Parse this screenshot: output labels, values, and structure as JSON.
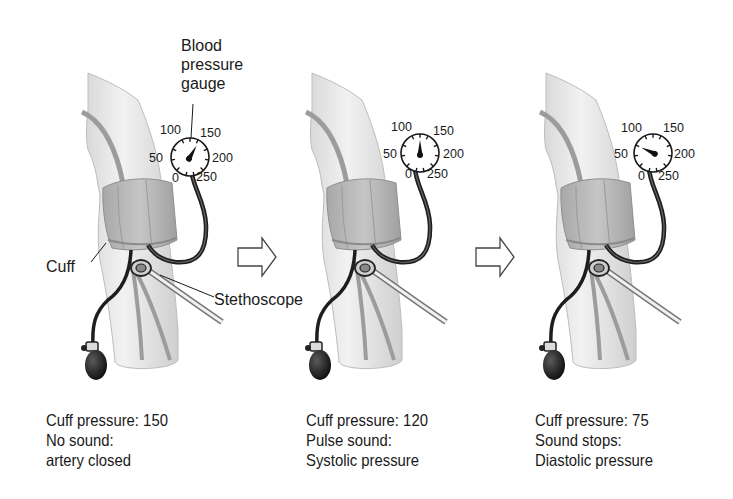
{
  "labels": {
    "gauge_title_line1": "Blood",
    "gauge_title_line2": "pressure",
    "gauge_title_line3": "gauge",
    "cuff": "Cuff",
    "stethoscope": "Stethoscope"
  },
  "gauge_scale": [
    "0",
    "50",
    "100",
    "150",
    "200",
    "250"
  ],
  "panels": [
    {
      "cuff_pressure": "Cuff pressure: 150",
      "sound": "No sound:",
      "meaning": "artery closed",
      "needle_value": 150
    },
    {
      "cuff_pressure": "Cuff pressure: 120",
      "sound": "Pulse sound:",
      "meaning": "Systolic pressure",
      "needle_value": 120
    },
    {
      "cuff_pressure": "Cuff pressure: 75",
      "sound": "Sound stops:",
      "meaning": "Diastolic pressure",
      "needle_value": 75
    }
  ],
  "colors": {
    "skin": "#ebebeb",
    "artery": "#9a9a9a",
    "cuff": "#b5b5b5",
    "tube": "#1e1e1e",
    "arrow_fill": "#ffffff",
    "arrow_stroke": "#444444"
  }
}
